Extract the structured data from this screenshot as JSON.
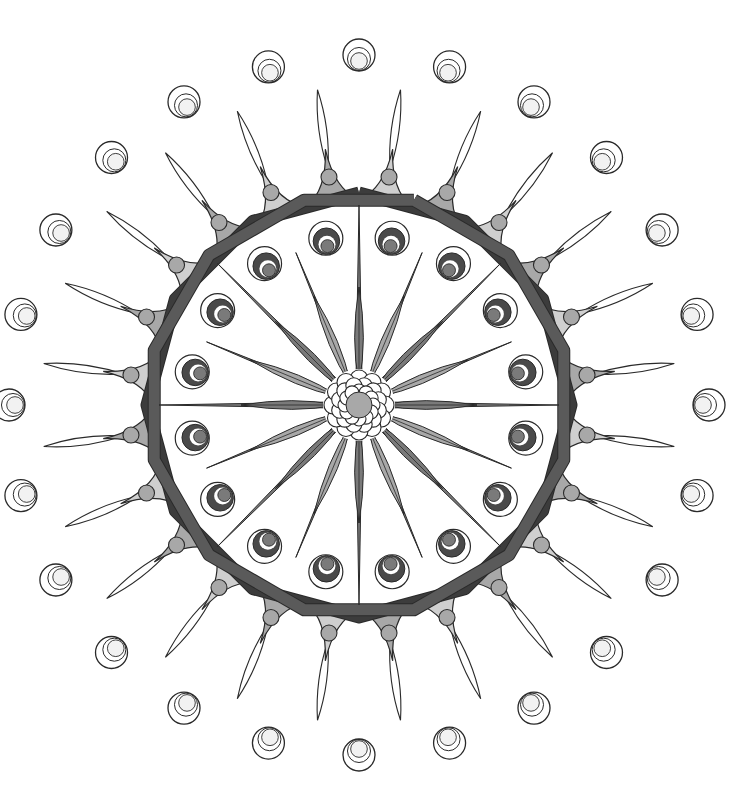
{
  "artwork": {
    "type": "mandala",
    "center": [
      359,
      405
    ],
    "colors": {
      "background": "#ffffff",
      "line": "#2a2a2a",
      "dark": "#4a4a4a",
      "mid": "#7a7a7a",
      "light": "#a8a8a8",
      "pale": "#cfcfcf",
      "ring_dark": "#3c3c3c",
      "ring_mid": "#5a5a5a"
    },
    "outer_circles": {
      "count": 24,
      "radius": 350,
      "size": 16
    },
    "lens_spokes": {
      "count": 24,
      "inner": 238,
      "outer": 318
    },
    "cusp_triangles": {
      "count": 24,
      "base_radius": 205,
      "tip_radius": 258,
      "dot_radius": 230,
      "dot_size": 8
    },
    "ring_bands": {
      "sides": 12,
      "radius": 212,
      "width": 11,
      "rotation_offset": 15
    },
    "inner_circles": {
      "count": 16,
      "radius": 170,
      "size": 17
    },
    "spikes": {
      "long_count": 8,
      "long_length": 200,
      "short_count": 8,
      "short_length": 165,
      "offset_deg": 22.5
    },
    "petals": {
      "count": 16,
      "length": 118,
      "width": 14
    },
    "center_flower": {
      "rings": 12,
      "radius": 26,
      "petal_size": 9,
      "core_size": 13
    }
  }
}
